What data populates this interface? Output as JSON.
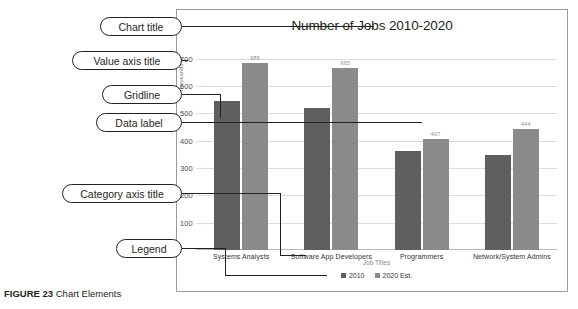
{
  "figure": {
    "caption_label": "FIGURE 23",
    "caption_text": "Chart Elements"
  },
  "callouts": [
    {
      "id": "chart-title",
      "label": "Chart title"
    },
    {
      "id": "value-axis-title",
      "label": "Value axis title"
    },
    {
      "id": "gridline",
      "label": "Gridline"
    },
    {
      "id": "data-label",
      "label": "Data label"
    },
    {
      "id": "category-axis-title",
      "label": "Category axis title"
    },
    {
      "id": "legend",
      "label": "Legend"
    }
  ],
  "chart_data": {
    "type": "bar",
    "title": "Number of Jobs 2010-2020",
    "xlabel": "Job Titles",
    "ylabel": "Thousands",
    "categories": [
      "Systems Analysts",
      "Software App Developers",
      "Programmers",
      "Network/System Admins"
    ],
    "series": [
      {
        "name": "2010",
        "color": "#5f5f5f",
        "values": [
          544,
          520,
          363,
          347
        ]
      },
      {
        "name": "2020 Est.",
        "color": "#8a8a8a",
        "values": [
          685,
          665,
          407,
          444
        ]
      }
    ],
    "data_labels": {
      "2010": [
        "",
        "",
        "",
        ""
      ],
      "2020 Est.": [
        "685",
        "665",
        "407",
        "444"
      ]
    },
    "yticks": [
      "700",
      "600",
      "500",
      "400",
      "300",
      "200",
      "100"
    ],
    "ylim": [
      0,
      750
    ],
    "grid": true,
    "legend_position": "bottom"
  }
}
